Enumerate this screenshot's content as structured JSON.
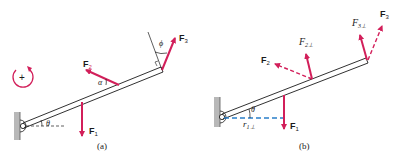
{
  "colors": {
    "force": "#d21f5a",
    "line": "#1a1a1a",
    "lever_arm": "#2a7fc9",
    "wall": "#b8b8b8"
  },
  "rotation_sign": "+",
  "panel_a": {
    "caption": "(a)",
    "labels": {
      "F1": "F",
      "F1_sub": "1",
      "F2": "F",
      "F2_sub": "2",
      "F3": "F",
      "F3_sub": "3",
      "theta": "θ",
      "alpha": "α",
      "phi": "ϕ"
    }
  },
  "panel_b": {
    "caption": "(b)",
    "labels": {
      "F1": "F",
      "F1_sub": "1",
      "F2": "F",
      "F2_sub": "2",
      "F3": "F",
      "F3_sub": "3",
      "F2perp": "F",
      "F2perp_sub": "2⊥",
      "F3perp": "F",
      "F3perp_sub": "3⊥",
      "r1perp": "r",
      "r1perp_sub": "1⊥",
      "theta": "θ"
    }
  }
}
